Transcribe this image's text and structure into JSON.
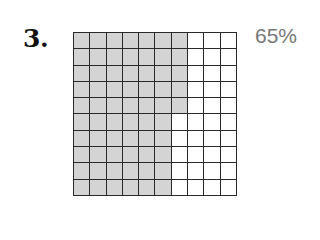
{
  "problem": {
    "number_label": "3.",
    "percent_label": "65%"
  },
  "grid": {
    "rows": 10,
    "columns": 10,
    "shaded_per_row": [
      7,
      7,
      7,
      7,
      7,
      6,
      6,
      6,
      6,
      6
    ],
    "shaded_total": 65,
    "colors": {
      "shaded": "#d4d4d4",
      "unshaded": "#ffffff",
      "lines": "#2a2a2a"
    }
  }
}
